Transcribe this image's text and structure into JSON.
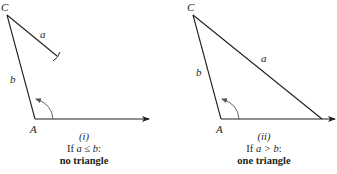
{
  "figures": [
    {
      "id": "i",
      "vertices": {
        "C": "C",
        "A": "A"
      },
      "sides": {
        "a": "a",
        "b": "b"
      },
      "caption": {
        "number": "(i)",
        "condition_prefix": "If ",
        "condition_math": "a ≤ b",
        "condition_suffix": ":",
        "result": "no triangle"
      }
    },
    {
      "id": "ii",
      "vertices": {
        "C": "C",
        "A": "A"
      },
      "sides": {
        "a": "a",
        "b": "b"
      },
      "caption": {
        "number": "(ii)",
        "condition_prefix": "If ",
        "condition_math": "a > b",
        "condition_suffix": ":",
        "result": "one triangle"
      }
    }
  ],
  "colors": {
    "line": "#231f20",
    "background": "#ffffff"
  }
}
